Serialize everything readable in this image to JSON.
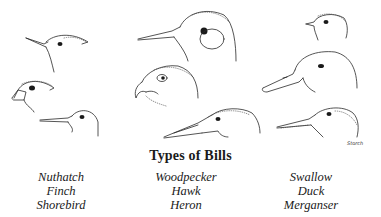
{
  "figure": {
    "title": "Types of Bills",
    "signature": "Storch",
    "columns": [
      {
        "labels": [
          "Nuthatch",
          "Finch",
          "Shorebird"
        ]
      },
      {
        "labels": [
          "Woodpecker",
          "Hawk",
          "Heron"
        ]
      },
      {
        "labels": [
          "Swallow",
          "Duck",
          "Merganser"
        ]
      }
    ],
    "birds": [
      {
        "name": "Nuthatch",
        "bill": "chisel-like pointed"
      },
      {
        "name": "Finch",
        "bill": "short conical"
      },
      {
        "name": "Shorebird",
        "bill": "long thin probing"
      },
      {
        "name": "Woodpecker",
        "bill": "strong chisel"
      },
      {
        "name": "Hawk",
        "bill": "hooked"
      },
      {
        "name": "Heron",
        "bill": "long spear-like"
      },
      {
        "name": "Swallow",
        "bill": "small wide gape"
      },
      {
        "name": "Duck",
        "bill": "broad flat"
      },
      {
        "name": "Merganser",
        "bill": "serrated narrow"
      }
    ]
  }
}
